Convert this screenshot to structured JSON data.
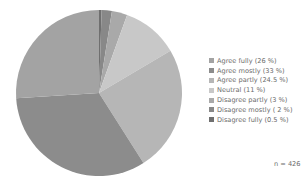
{
  "chart_data": {
    "type": "pie",
    "title": "",
    "start_angle_deg": 0,
    "direction": "clockwise, starting at 12 o'clock",
    "slices": [
      {
        "label": "Disagree fully (0.5 %)",
        "category": "Disagree fully",
        "value": 0.5,
        "color": "#6f6f6f"
      },
      {
        "label": "Disagree mostly ( 2 %)",
        "category": "Disagree mostly",
        "value": 2,
        "color": "#888888"
      },
      {
        "label": "Disagree partly (3 %)",
        "category": "Disagree partly",
        "value": 3,
        "color": "#a9a9a9"
      },
      {
        "label": "Neutral (11 %)",
        "category": "Neutral",
        "value": 11,
        "color": "#c8c8c8"
      },
      {
        "label": "Agree partly (24.5 %)",
        "category": "Agree partly",
        "value": 24.5,
        "color": "#b6b6b6"
      },
      {
        "label": "Agree mostly (33 %)",
        "category": "Agree mostly",
        "value": 33,
        "color": "#8c8c8c"
      },
      {
        "label": "Agree fully (26 %)",
        "category": "Agree fully",
        "value": 26,
        "color": "#a3a3a3"
      }
    ],
    "legend": {
      "position": "right",
      "entries": [
        {
          "label": "Agree fully (26 %)",
          "color": "#a3a3a3"
        },
        {
          "label": "Agree mostly (33 %)",
          "color": "#8c8c8c"
        },
        {
          "label": "Agree partly (24.5 %)",
          "color": "#b6b6b6"
        },
        {
          "label": "Neutral (11 %)",
          "color": "#c8c8c8"
        },
        {
          "label": "Disagree partly (3 %)",
          "color": "#a9a9a9"
        },
        {
          "label": "Disagree mostly ( 2 %)",
          "color": "#888888"
        },
        {
          "label": "Disagree fully (0.5 %)",
          "color": "#6f6f6f"
        }
      ]
    },
    "annotation": "n = 426"
  },
  "legend": {
    "items": [
      {
        "label": "Agree fully (26 %)"
      },
      {
        "label": "Agree mostly (33 %)"
      },
      {
        "label": "Agree partly (24.5 %)"
      },
      {
        "label": "Neutral (11 %)"
      },
      {
        "label": "Disagree partly (3 %)"
      },
      {
        "label": "Disagree mostly ( 2 %)"
      },
      {
        "label": "Disagree fully (0.5 %)"
      }
    ]
  },
  "sample_size": "n = 426"
}
